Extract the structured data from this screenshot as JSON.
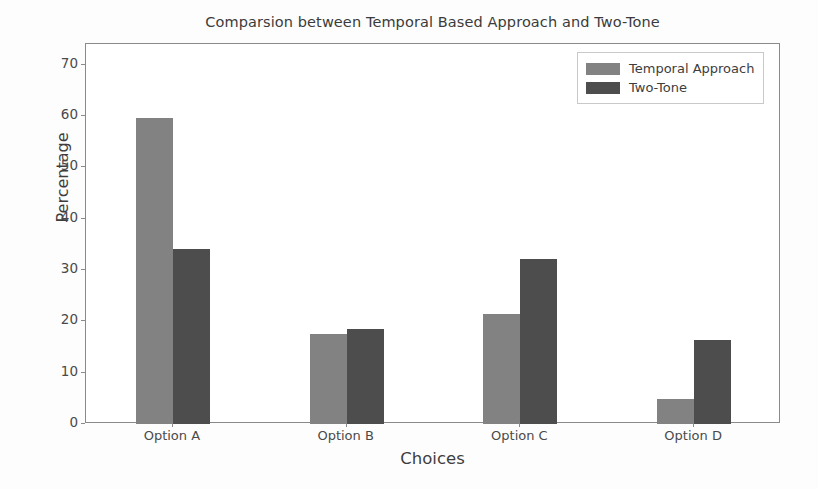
{
  "chart_data": {
    "type": "bar",
    "title": "Comparsion between Temporal Based Approach and Two-Tone",
    "xlabel": "Choices",
    "ylabel": "Percentage",
    "categories": [
      "Option A",
      "Option B",
      "Option C",
      "Option D"
    ],
    "series": [
      {
        "name": "Temporal Approach",
        "values": [
          59.6,
          17.5,
          21.4,
          4.8
        ],
        "color": "#828282"
      },
      {
        "name": "Two-Tone",
        "values": [
          34.1,
          18.5,
          32.1,
          16.4
        ],
        "color": "#4d4d4d"
      }
    ],
    "ylim": [
      0,
      74
    ],
    "yticks": [
      0,
      10,
      20,
      30,
      40,
      50,
      60,
      70
    ],
    "ytick_labels": [
      "0",
      "10",
      "20",
      "30",
      "40",
      "50",
      "60",
      "70"
    ],
    "grid": false,
    "legend_position": "upper right",
    "bar_width_px": 37
  }
}
